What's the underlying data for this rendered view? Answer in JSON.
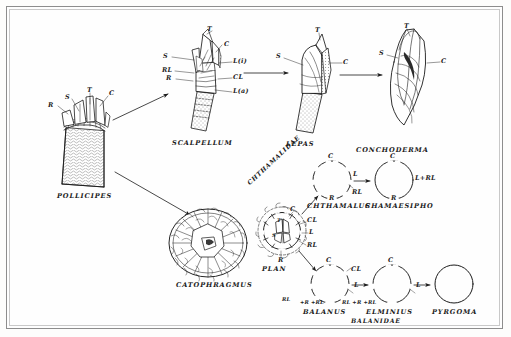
{
  "figure": {
    "domain_note": "scanned line-drawing plate: barnacle shell-plate reduction series",
    "border_color": "#8d8d8d",
    "ink_color": "#1b1b1b"
  },
  "taxa": {
    "pollicipes": "POLLICIPES",
    "scalpellum": "SCALPELLUM",
    "lepas": "LEPAS",
    "conchoderma": "CONCHODERMA",
    "catophragmus": "CATOPHRAGMUS",
    "plan": "PLAN",
    "chthamalus": "CHTHAMALUS",
    "chamaesipho": "CHAMAESIPHO",
    "balanus": "BALANUS",
    "elminius": "ELMINIUS",
    "pyrgoma": "PYRGOMA"
  },
  "families": {
    "chthamalidae": "CHTHAMALIDAE",
    "balanidae": "BALANIDAE"
  },
  "plate_labels": {
    "t": "T",
    "s": "S",
    "c": "C",
    "r": "R",
    "rl": "RL",
    "cl": "CL",
    "l": "L",
    "l_inner": "L(i)",
    "l_outer": "L(a)",
    "l_plus_rl": "L+RL",
    "rl_r_rl": "RL +R +RL"
  },
  "pollicipes_labels": [
    "R",
    "S",
    "T",
    "C"
  ],
  "scalpellum_labels_left": [
    "S",
    "RL",
    "R"
  ],
  "scalpellum_labels_right": [
    "T",
    "C",
    "L(i)",
    "CL",
    "L(a)"
  ],
  "lepas_labels": [
    "S",
    "T",
    "C"
  ],
  "conchoderma_labels": [
    "S",
    "T",
    "C"
  ],
  "plan_labels": {
    "top": "C",
    "upper_right": "CL",
    "right": "L",
    "lower_right": "RL",
    "bottom": "R",
    "inner_top": "T",
    "inner_left": "S"
  },
  "chthamalus_labels": {
    "top": "C",
    "right": "L",
    "lower_right": "RL",
    "bottom": "R"
  },
  "chamaesipho_labels": {
    "top": "C",
    "right": "L+RL",
    "bottom": "R"
  },
  "balanus_labels": {
    "top": "C",
    "upper_right": "CL",
    "right": "L",
    "bottom_left": "RL",
    "bottom": "+R +RL"
  },
  "elminius_labels": {
    "top": "C",
    "right": "L",
    "bottom": "RL +R +RL"
  },
  "pyrgoma_labels": {}
}
